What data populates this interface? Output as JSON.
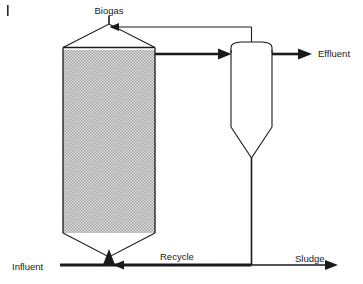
{
  "diagram": {
    "type": "process-flow-diagram",
    "background_color": "#ffffff",
    "line_color": "#1a1a1a",
    "media_fill_color": "#c9c9c9",
    "vessel_fill_color": "#ffffff",
    "labels": {
      "biogas": "Biogas",
      "effluent": "Effluent",
      "sludge": "Sludge",
      "recycle": "Recycle",
      "influent": "Influent"
    },
    "units": [
      {
        "id": "reactor",
        "name": "anaerobic-reactor",
        "description": "Tall packed/sludge-bed column with triangular gas cap and conical bottom",
        "fill": "media-hatch"
      },
      {
        "id": "settler",
        "name": "settler-clarifier",
        "description": "Domed-top vessel with conical bottom",
        "fill": "none"
      }
    ],
    "streams": [
      {
        "id": "influent",
        "label": "Influent",
        "direction": "right-then-up",
        "weight": "thick"
      },
      {
        "id": "reactor-to-settler",
        "label": "",
        "direction": "right",
        "weight": "thick"
      },
      {
        "id": "effluent",
        "label": "Effluent",
        "direction": "right",
        "weight": "thick"
      },
      {
        "id": "gas-return",
        "label": "Biogas",
        "direction": "left",
        "weight": "thin"
      },
      {
        "id": "settler-underflow",
        "label": "",
        "direction": "down",
        "weight": "thin"
      },
      {
        "id": "recycle",
        "label": "Recycle",
        "direction": "left",
        "weight": "thick"
      },
      {
        "id": "sludge",
        "label": "Sludge",
        "direction": "right",
        "weight": "thin"
      }
    ]
  }
}
